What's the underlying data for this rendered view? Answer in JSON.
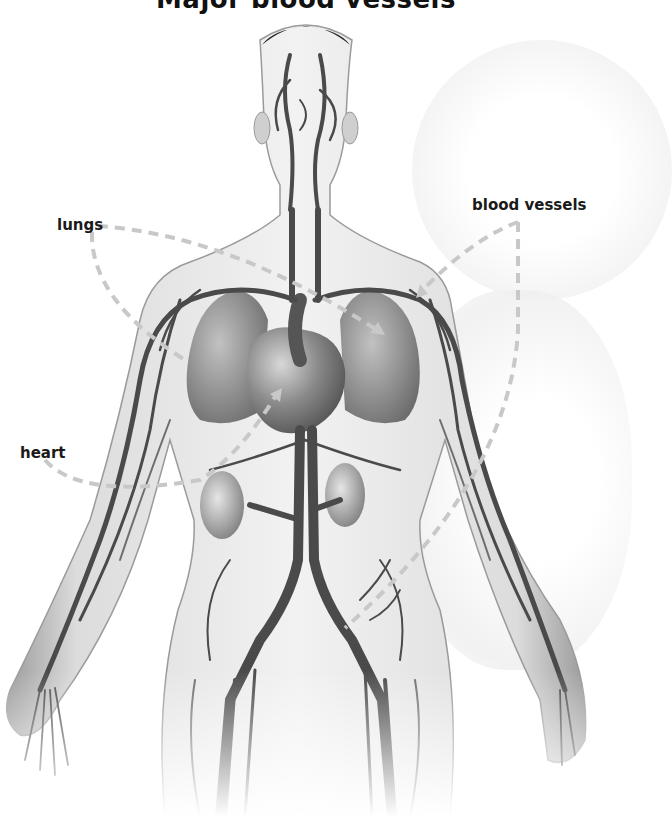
{
  "title": "Major blood vessels",
  "labels": {
    "lungs": "lungs",
    "heart": "heart",
    "blood_vessels": "blood vessels"
  },
  "colors": {
    "background": "#ffffff",
    "body_fill": "#e4e4e4",
    "body_edge": "#8a8a8a",
    "vessel": "#4a4a4a",
    "vessel_light": "#6e6e6e",
    "organ": "#7c7c7c",
    "leader_line": "#c8c8c8",
    "label_text": "#1a1a1a"
  },
  "annotations": [
    {
      "label": "lungs",
      "targets": [
        "left-lung",
        "right-lung"
      ]
    },
    {
      "label": "heart",
      "targets": [
        "heart"
      ]
    },
    {
      "label": "blood vessels",
      "targets": [
        "left-arm-vessels",
        "abdominal-vessels"
      ]
    }
  ]
}
